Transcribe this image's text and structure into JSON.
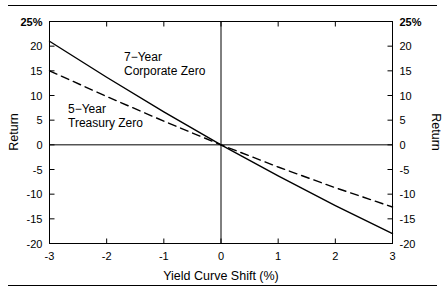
{
  "figure": {
    "has_top_rule": true,
    "has_bottom_rule": true,
    "background": "#ffffff",
    "ink": "#000000"
  },
  "chart_data": {
    "type": "line",
    "title": "",
    "xlabel": "Yield Curve Shift (%)",
    "ylabel": "Return",
    "ylabel_right": "Return",
    "xlim": [
      -3,
      3
    ],
    "ylim": [
      -20,
      25
    ],
    "grid": false,
    "legend_position": "inline-annotations",
    "xticks": [
      -3,
      -2,
      -1,
      0,
      1,
      2,
      3
    ],
    "xticklabels": [
      "-3",
      "-2",
      "-1",
      "0",
      "1",
      "2",
      "3"
    ],
    "yticks": [
      -20,
      -15,
      -10,
      -5,
      0,
      5,
      10,
      15,
      20,
      25
    ],
    "yticklabels": [
      "-20",
      "-15",
      "-10",
      "-5",
      "0",
      "5",
      "10",
      "15",
      "20",
      "25%"
    ],
    "ytick_top_label": "25%",
    "zero_lines": {
      "horizontal": 0,
      "vertical": 0
    },
    "x": [
      -3,
      -2,
      -1,
      0,
      1,
      2,
      3
    ],
    "series": [
      {
        "name": "7-Year Corporate Zero",
        "style": "solid",
        "color": "#000000",
        "annotation_lines": [
          "7−Year",
          "Corporate Zero"
        ],
        "values": [
          21.0,
          13.7,
          6.7,
          0.0,
          -6.3,
          -12.3,
          -18.0
        ]
      },
      {
        "name": "5-Year Treasury Zero",
        "style": "dashed",
        "color": "#000000",
        "annotation_lines": [
          "5−Year",
          "Treasury Zero"
        ],
        "values": [
          15.0,
          9.8,
          4.8,
          0.0,
          -4.5,
          -8.7,
          -12.6
        ]
      }
    ]
  },
  "annotations": {
    "corporate": {
      "line1": "7−Year",
      "line2": "Corporate Zero"
    },
    "treasury": {
      "line1": "5−Year",
      "line2": "Treasury Zero"
    }
  },
  "axes": {
    "x_title": "Yield Curve Shift (%)",
    "y_title_left": "Return",
    "y_title_right": "Return"
  }
}
